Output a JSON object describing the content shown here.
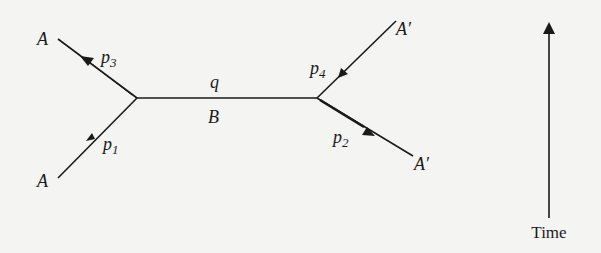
{
  "diagram": {
    "title": "",
    "vertices": [
      {
        "id": "v1",
        "x": 137,
        "y": 98
      },
      {
        "id": "v2",
        "x": 317,
        "y": 98
      }
    ],
    "particles": {
      "A_in": {
        "label": "A",
        "momentum": "p",
        "momentum_sub": "1"
      },
      "A_out": {
        "label": "A",
        "momentum": "p",
        "momentum_sub": "3"
      },
      "Aprime_in": {
        "label": "A′",
        "momentum": "p",
        "momentum_sub": "4"
      },
      "Aprime_out": {
        "label": "A′",
        "momentum": "p",
        "momentum_sub": "2"
      },
      "propagator": {
        "label": "B",
        "momentum": "q"
      }
    },
    "time_axis": {
      "label": "Time",
      "direction": "up"
    },
    "colors": {
      "ink": "#1a1a1a",
      "paper": "#f4f4f2"
    }
  }
}
